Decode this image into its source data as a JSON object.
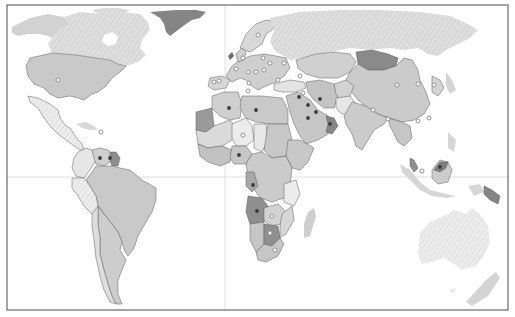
{
  "map": {
    "type": "choropleth-world-map",
    "projection": "equirectangular",
    "frame": {
      "x": 7,
      "y": 5,
      "width": 501,
      "height": 305
    },
    "graticule": {
      "equator_y": 177,
      "prime_meridian_x": 225
    },
    "colors": {
      "background": "#ffffff",
      "frame": "#555555",
      "graticule": "#d6d6d6",
      "ocean": "#ffffff",
      "land_light": "#e6e6e6",
      "land_hatched": "#dadada",
      "land_mid": "#c4c4c4",
      "land_dark": "#9a9a9a",
      "land_darkest": "#7d7d7d",
      "border": "#5a5a5a",
      "dot_filled": "#3a3a3a",
      "dot_hollow_fill": "#ffffff",
      "dot_hollow_stroke": "#8a8a8a"
    },
    "legend": null,
    "title": null,
    "dark_shaded_countries": [
      "Greenland",
      "Mongolia",
      "Angola",
      "Botswana",
      "Oman",
      "Guyana",
      "Suriname",
      "Papua New Guinea",
      "Malaysia (Sabah/Sarawak)",
      "Mauritania"
    ],
    "markers": [
      {
        "kind": "hollow",
        "x": 58,
        "y": 80,
        "label": "United States"
      },
      {
        "kind": "hollow",
        "x": 101,
        "y": 132,
        "label": "Caribbean"
      },
      {
        "kind": "filled",
        "x": 100,
        "y": 158,
        "label": "Venezuela"
      },
      {
        "kind": "filled",
        "x": 110,
        "y": 158,
        "label": "Guyana"
      },
      {
        "kind": "filled",
        "x": 229,
        "y": 108,
        "label": "Algeria"
      },
      {
        "kind": "filled",
        "x": 256,
        "y": 110,
        "label": "Libya"
      },
      {
        "kind": "hollow",
        "x": 243,
        "y": 135,
        "label": "Niger"
      },
      {
        "kind": "filled",
        "x": 239,
        "y": 155,
        "label": "Nigeria"
      },
      {
        "kind": "filled",
        "x": 253,
        "y": 185,
        "label": "Congo"
      },
      {
        "kind": "filled",
        "x": 257,
        "y": 211,
        "label": "Angola"
      },
      {
        "kind": "hollow",
        "x": 272,
        "y": 216,
        "label": "Zambia"
      },
      {
        "kind": "hollow",
        "x": 270,
        "y": 233,
        "label": "Botswana"
      },
      {
        "kind": "hollow",
        "x": 275,
        "y": 250,
        "label": "South Africa"
      },
      {
        "kind": "filled",
        "x": 299,
        "y": 97,
        "label": "Iraq"
      },
      {
        "kind": "filled",
        "x": 320,
        "y": 99,
        "label": "Iran"
      },
      {
        "kind": "filled",
        "x": 308,
        "y": 105,
        "label": "Kuwait"
      },
      {
        "kind": "filled",
        "x": 316,
        "y": 112,
        "label": "Qatar"
      },
      {
        "kind": "filled",
        "x": 308,
        "y": 118,
        "label": "Saudi Arabia"
      },
      {
        "kind": "filled",
        "x": 330,
        "y": 124,
        "label": "Oman"
      },
      {
        "kind": "hollow",
        "x": 397,
        "y": 85,
        "label": "China"
      },
      {
        "kind": "hollow",
        "x": 434,
        "y": 85,
        "label": "Japan"
      },
      {
        "kind": "hollow",
        "x": 418,
        "y": 84,
        "label": "Korea"
      },
      {
        "kind": "hollow",
        "x": 373,
        "y": 110,
        "label": "Nepal"
      },
      {
        "kind": "hollow",
        "x": 388,
        "y": 119,
        "label": "Bangladesh"
      },
      {
        "kind": "hollow",
        "x": 429,
        "y": 118,
        "label": "Taiwan"
      },
      {
        "kind": "hollow",
        "x": 418,
        "y": 121,
        "label": "Hong Kong"
      },
      {
        "kind": "filled",
        "x": 440,
        "y": 167,
        "label": "Brunei"
      },
      {
        "kind": "hollow",
        "x": 422,
        "y": 171,
        "label": "Singapore"
      },
      {
        "kind": "hollow",
        "x": 258,
        "y": 35,
        "label": "Norway"
      },
      {
        "kind": "hollow",
        "x": 243,
        "y": 58,
        "label": "United Kingdom"
      },
      {
        "kind": "hollow",
        "x": 236,
        "y": 69,
        "label": "France"
      },
      {
        "kind": "hollow",
        "x": 248,
        "y": 72,
        "label": "Switzerland"
      },
      {
        "kind": "hollow",
        "x": 256,
        "y": 72,
        "label": "Austria"
      },
      {
        "kind": "hollow",
        "x": 264,
        "y": 70,
        "label": "Hungary"
      },
      {
        "kind": "hollow",
        "x": 270,
        "y": 63,
        "label": "Poland"
      },
      {
        "kind": "hollow",
        "x": 263,
        "y": 58,
        "label": "Germany"
      },
      {
        "kind": "hollow",
        "x": 284,
        "y": 63,
        "label": "Ukraine"
      },
      {
        "kind": "hollow",
        "x": 278,
        "y": 80,
        "label": "Balkans"
      },
      {
        "kind": "hollow",
        "x": 249,
        "y": 83,
        "label": "Italy"
      },
      {
        "kind": "hollow",
        "x": 214,
        "y": 82,
        "label": "Spain"
      },
      {
        "kind": "hollow",
        "x": 219,
        "y": 81,
        "label": "Portugal"
      },
      {
        "kind": "hollow",
        "x": 248,
        "y": 91,
        "label": "Tunisia"
      },
      {
        "kind": "hollow",
        "x": 300,
        "y": 76,
        "label": "Georgia"
      },
      {
        "kind": "hollow",
        "x": 303,
        "y": 93,
        "label": "Syria"
      }
    ]
  }
}
